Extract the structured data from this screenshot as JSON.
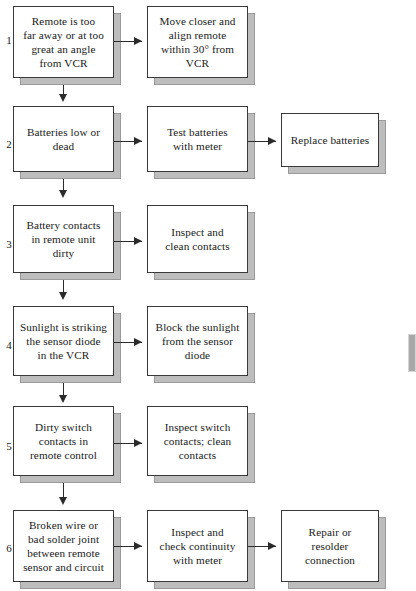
{
  "diagram": {
    "colors": {
      "box_fill": "#ffffff",
      "box_border": "#3a3a3a",
      "shadow": "#bdbdbd",
      "connector": "#2b2b2b",
      "background": "#ffffff"
    },
    "rows": [
      {
        "number": "1",
        "problem": "Remote is too\nfar away or at too\ngreat an angle\nfrom VCR",
        "action": "Move closer and\nalign remote\nwithin 30° from\nVCR",
        "result": null
      },
      {
        "number": "2",
        "problem": "Batteries low or\ndead",
        "action": "Test batteries\nwith meter",
        "result": "Replace batteries"
      },
      {
        "number": "3",
        "problem": "Battery contacts\nin remote unit\ndirty",
        "action": "Inspect and\nclean contacts",
        "result": null
      },
      {
        "number": "4",
        "problem": "Sunlight is striking\nthe sensor diode\nin the VCR",
        "action": "Block the sunlight\nfrom the sensor\ndiode",
        "result": null
      },
      {
        "number": "5",
        "problem": "Dirty switch\ncontacts in\nremote control",
        "action": "Inspect switch\ncontacts; clean\ncontacts",
        "result": null
      },
      {
        "number": "6",
        "problem": "Broken wire or\nbad solder joint\nbetween remote\nsensor and circuit",
        "action": "Inspect and\ncheck continuity\nwith meter",
        "result": "Repair or\nresolder\nconnection"
      }
    ]
  }
}
